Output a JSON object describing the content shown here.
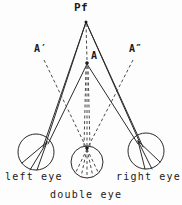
{
  "figure": {
    "colors": {
      "stroke": "#2b2b2b",
      "dashed": "#4a4a4a",
      "background": "#fdfdfd"
    },
    "labels": {
      "pf": "Pf",
      "a": "A",
      "a_prime": "A′",
      "a_double_prime": "A″",
      "left_eye": "left eye",
      "right_eye": "right eye",
      "double_eye": "double eye"
    },
    "points": {
      "pf": {
        "x": 86,
        "y": 21
      },
      "a": {
        "x": 87,
        "y": 63
      },
      "a_prime": {
        "x": 40,
        "y": 54
      },
      "a_dprime": {
        "x": 134,
        "y": 54
      },
      "left_node": {
        "x": 47,
        "y": 142
      },
      "right_node": {
        "x": 139,
        "y": 142
      },
      "center_node": {
        "x": 87,
        "y": 148
      }
    },
    "eyes": [
      {
        "name": "left eye",
        "cx": 36,
        "cy": 152,
        "r": 18
      },
      {
        "name": "double eye",
        "cx": 87,
        "cy": 162,
        "r": 16
      },
      {
        "name": "right eye",
        "cx": 146,
        "cy": 151,
        "r": 18
      }
    ]
  }
}
